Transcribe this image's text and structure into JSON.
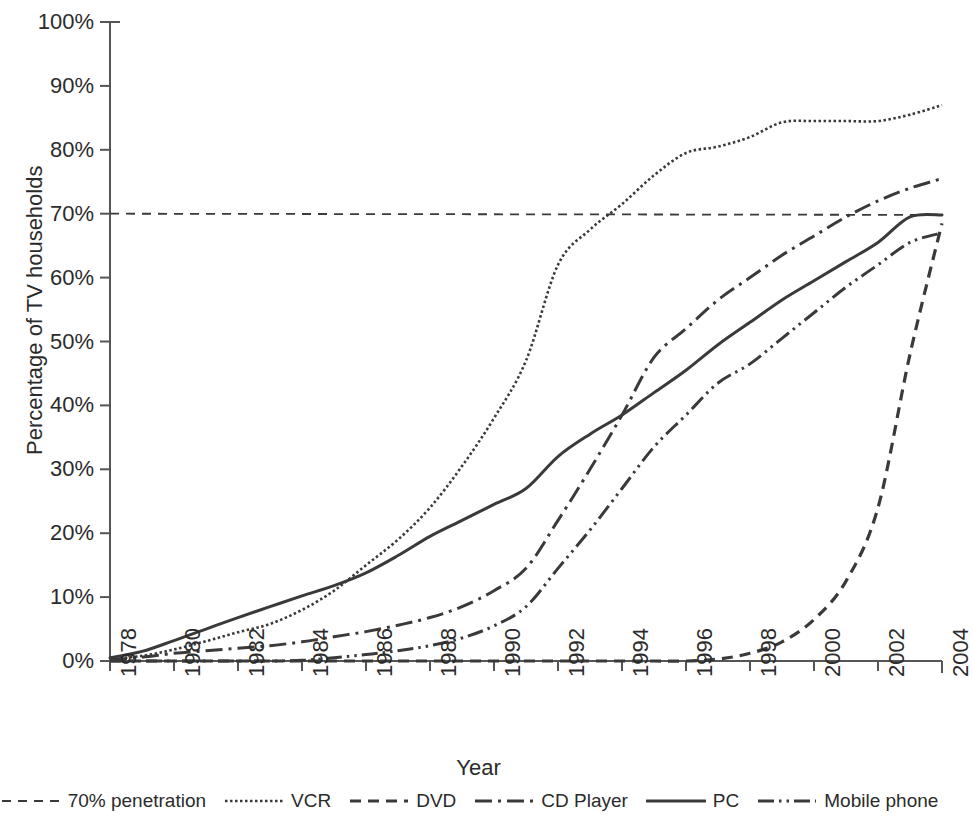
{
  "chart_data": {
    "type": "line",
    "title": "",
    "xlabel": "Year",
    "ylabel": "Percentage of TV households",
    "xlim": [
      1978,
      2004
    ],
    "ylim": [
      0,
      100
    ],
    "grid": false,
    "legend_position": "bottom",
    "y_ticks": [
      "0%",
      "10%",
      "20%",
      "30%",
      "40%",
      "50%",
      "60%",
      "70%",
      "80%",
      "90%",
      "100%"
    ],
    "y_tick_values": [
      0,
      10,
      20,
      30,
      40,
      50,
      60,
      70,
      80,
      90,
      100
    ],
    "x_ticks": [
      "1978",
      "1980",
      "1982",
      "1984",
      "1986",
      "1988",
      "1990",
      "1992",
      "1994",
      "1996",
      "1998",
      "2000",
      "2002",
      "2004"
    ],
    "x_tick_values": [
      1978,
      1980,
      1982,
      1984,
      1986,
      1988,
      1990,
      1992,
      1994,
      1996,
      1998,
      2000,
      2002,
      2004
    ],
    "x": [
      1978,
      1979,
      1980,
      1981,
      1982,
      1983,
      1984,
      1985,
      1986,
      1987,
      1988,
      1989,
      1990,
      1991,
      1992,
      1993,
      1994,
      1995,
      1996,
      1997,
      1998,
      1999,
      2000,
      2001,
      2002,
      2003,
      2004
    ],
    "series": [
      {
        "name": "70% penetration",
        "style": "dashed",
        "color": "#3a3a3a",
        "values": [
          70,
          70,
          70,
          70,
          70,
          70,
          70,
          70,
          70,
          70,
          70,
          70,
          70,
          70,
          70,
          70,
          70,
          70,
          70,
          70,
          70,
          70,
          70,
          70,
          70,
          69.5,
          69.3
        ]
      },
      {
        "name": "VCR",
        "style": "dotted",
        "color": "#3a3a3a",
        "values": [
          0.3,
          0.8,
          1.8,
          3.1,
          4.5,
          5.8,
          8.0,
          11.0,
          15.0,
          19.0,
          24.0,
          30.5,
          38.0,
          47.0,
          62.0,
          67.5,
          71.5,
          76.0,
          79.5,
          80.5,
          82.0,
          84.3,
          84.5,
          84.5,
          84.5,
          85.5,
          87.0
        ]
      },
      {
        "name": "DVD",
        "style": "dashed-thick",
        "color": "#3a3a3a",
        "values": [
          0,
          0,
          0,
          0,
          0,
          0,
          0,
          0,
          0,
          0,
          0,
          0,
          0,
          0,
          0,
          0,
          0,
          0,
          0,
          0.3,
          1.2,
          3.0,
          6.5,
          12.5,
          24.0,
          48.0,
          68.5
        ]
      },
      {
        "name": "CD Player",
        "style": "dash-dot",
        "color": "#3a3a3a",
        "values": [
          0.2,
          0.6,
          1.2,
          1.6,
          2.0,
          2.4,
          3.0,
          3.8,
          4.6,
          5.6,
          6.8,
          8.5,
          11.0,
          14.5,
          22.0,
          30.0,
          38.5,
          47.5,
          52.0,
          56.5,
          60.0,
          63.5,
          66.5,
          69.5,
          72.0,
          74.0,
          75.5
        ]
      },
      {
        "name": "PC",
        "style": "solid",
        "color": "#3a3a3a",
        "values": [
          0.5,
          1.5,
          3.2,
          5.0,
          6.8,
          8.5,
          10.2,
          11.8,
          13.8,
          16.5,
          19.5,
          22.0,
          24.5,
          27.0,
          32.0,
          35.5,
          38.5,
          42.0,
          45.5,
          49.5,
          53.0,
          56.5,
          59.5,
          62.5,
          65.5,
          69.5,
          69.8
        ]
      },
      {
        "name": "Mobile phone",
        "style": "dash-dot-dot",
        "color": "#3a3a3a",
        "values": [
          0,
          0,
          0,
          0,
          0,
          0,
          0.1,
          0.5,
          1.0,
          1.6,
          2.4,
          3.6,
          5.5,
          8.5,
          14.5,
          20.5,
          27.0,
          33.5,
          38.5,
          43.5,
          46.5,
          50.5,
          54.5,
          58.5,
          62.0,
          65.5,
          67.0
        ]
      }
    ]
  },
  "legend": {
    "items": [
      {
        "label": "70% penetration",
        "swatch": "dashed-swatch"
      },
      {
        "label": "VCR",
        "swatch": "dotted-swatch"
      },
      {
        "label": "DVD",
        "swatch": "dashed-thick-swatch"
      },
      {
        "label": "CD Player",
        "swatch": "dash-dot-swatch"
      },
      {
        "label": "PC",
        "swatch": "solid-swatch"
      },
      {
        "label": "Mobile phone",
        "swatch": "dash-dot-dot-swatch"
      }
    ]
  },
  "axis": {
    "line_color": "#555555"
  }
}
